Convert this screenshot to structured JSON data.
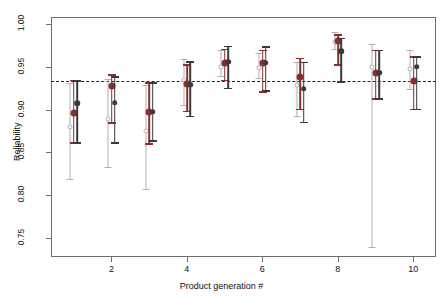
{
  "chart_data": {
    "type": "scatter",
    "title": "",
    "xlabel": "Product generation #",
    "ylabel": "Reliability",
    "xlim": [
      0.4,
      10.6
    ],
    "ylim": [
      0.728,
      1.008
    ],
    "grid": false,
    "legend": "none",
    "xticks": [
      2,
      4,
      6,
      8,
      10
    ],
    "xtick_labels": [
      "2",
      "4",
      "6",
      "8",
      "10"
    ],
    "yticks": [
      0.75,
      0.8,
      0.85,
      0.9,
      0.95,
      1.0
    ],
    "ytick_labels": [
      "0.75",
      "0.80",
      "0.85",
      "0.90",
      "0.95",
      "1.00"
    ],
    "x": [
      1,
      2,
      3,
      4,
      5,
      6,
      7,
      8,
      9,
      10
    ],
    "reference_line": {
      "y": 0.933,
      "style": "dashed",
      "color": "#222222"
    },
    "series": [
      {
        "name": "open-circle-series",
        "marker": "open-circle",
        "color": "#b0b0b0",
        "values": [
          0.8795,
          0.8885,
          0.8745,
          0.9345,
          0.95,
          0.948,
          0.929,
          0.979,
          0.95,
          0.9475
        ],
        "lower": [
          0.8185,
          0.833,
          0.8075,
          0.9055,
          0.939,
          0.937,
          0.892,
          0.971,
          0.7395,
          0.9245
        ],
        "upper": [
          0.9315,
          0.936,
          0.9285,
          0.9585,
          0.969,
          0.966,
          0.955,
          0.99,
          0.9765,
          0.969
        ]
      },
      {
        "name": "gray-filled-series",
        "marker": "filled-circle",
        "color": "#8b2e2e",
        "values": [
          0.8955,
          0.9275,
          0.8975,
          0.93,
          0.9545,
          0.9545,
          0.9385,
          0.98,
          0.943,
          0.9335
        ],
        "lower": [
          0.862,
          0.8855,
          0.8605,
          0.8985,
          0.935,
          0.9215,
          0.901,
          0.953,
          0.913,
          0.901
        ],
        "upper": [
          0.935,
          0.9415,
          0.932,
          0.953,
          0.971,
          0.97,
          0.9605,
          0.988,
          0.97,
          0.9625
        ]
      },
      {
        "name": "black-filled-series",
        "marker": "filled-circle",
        "color": "#3a3a3a",
        "values": [
          0.9075,
          0.908,
          0.8975,
          0.929,
          0.956,
          0.9545,
          0.9245,
          0.968,
          0.943,
          0.95
        ],
        "lower": [
          0.862,
          0.862,
          0.864,
          0.893,
          0.9255,
          0.9225,
          0.886,
          0.933,
          0.913,
          0.901
        ],
        "upper": [
          0.934,
          0.939,
          0.932,
          0.9565,
          0.9745,
          0.974,
          0.956,
          0.984,
          0.97,
          0.9625
        ]
      }
    ]
  }
}
